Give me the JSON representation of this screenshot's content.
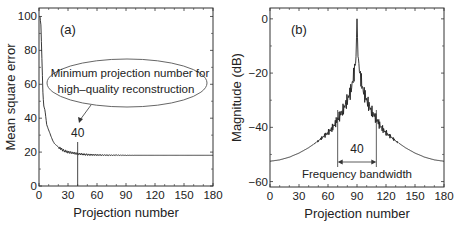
{
  "chart_data": [
    {
      "panel": "(a)",
      "type": "line",
      "title": "",
      "xlabel": "Projection number",
      "ylabel": "Mean square error",
      "xlim": [
        0,
        180
      ],
      "ylim": [
        0,
        105
      ],
      "xticks": [
        0,
        30,
        60,
        90,
        120,
        150,
        180
      ],
      "yticks": [
        0,
        20,
        40,
        60,
        80,
        100
      ],
      "xtick_labels": [
        "0",
        "30",
        "60",
        "90",
        "120",
        "150",
        "180"
      ],
      "ytick_labels": [
        "0",
        "20",
        "40",
        "60",
        "80",
        "100"
      ],
      "grid": false,
      "series": [
        {
          "name": "MSE",
          "x": [
            1,
            2,
            3,
            4,
            5,
            6,
            7,
            8,
            10,
            12,
            14,
            16,
            18,
            20,
            25,
            30,
            35,
            40,
            45,
            50,
            60,
            70,
            80,
            90,
            100,
            120,
            140,
            160,
            180
          ],
          "y": [
            100,
            95,
            75,
            55,
            47,
            45,
            41,
            36,
            33,
            30,
            27,
            25,
            24,
            23,
            21,
            20,
            19.5,
            19,
            18.7,
            18.5,
            18.3,
            18.2,
            18.2,
            18.1,
            18.1,
            18.1,
            18.1,
            18.1,
            18.1
          ]
        }
      ],
      "annotations": [
        {
          "text_lines": [
            "Minimum projection number for",
            "high–quality reconstruction"
          ],
          "shape": "ellipse"
        },
        {
          "text": "40",
          "marker_x": 40
        }
      ]
    },
    {
      "panel": "(b)",
      "type": "line",
      "title": "",
      "xlabel": "Projection number",
      "ylabel": "Magnitude (dB)",
      "xlim": [
        0,
        180
      ],
      "ylim": [
        -62,
        4
      ],
      "xticks": [
        0,
        30,
        60,
        90,
        120,
        150,
        180
      ],
      "yticks": [
        0,
        -20,
        -40,
        -60
      ],
      "xtick_labels": [
        "0",
        "30",
        "60",
        "90",
        "120",
        "150",
        "180"
      ],
      "ytick_labels": [
        "0",
        "−20",
        "−40",
        "−60"
      ],
      "grid": false,
      "series": [
        {
          "name": "Magnitude",
          "x": [
            0,
            10,
            20,
            30,
            40,
            50,
            60,
            65,
            70,
            75,
            80,
            84,
            87,
            89,
            90,
            91,
            93,
            96,
            100,
            105,
            110,
            115,
            120,
            130,
            140,
            150,
            160,
            170,
            180
          ],
          "y": [
            -52.5,
            -52,
            -51,
            -49.5,
            -47.5,
            -45,
            -42,
            -40,
            -37,
            -34,
            -30,
            -26,
            -20,
            -14,
            0,
            -14,
            -20,
            -26,
            -30,
            -34,
            -37,
            -40,
            -42,
            -45,
            -47.5,
            -49.5,
            -51,
            -52,
            -52.5
          ]
        }
      ],
      "annotations": [
        {
          "text": "40",
          "span": [
            70,
            110
          ]
        },
        {
          "text": "Frequency bandwidth"
        }
      ]
    }
  ]
}
